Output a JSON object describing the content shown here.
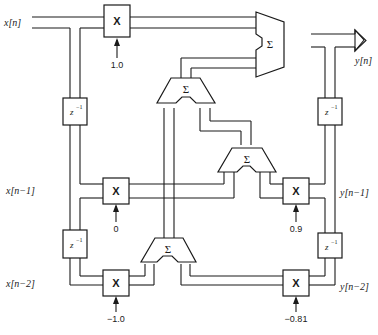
{
  "diagram": {
    "type": "block-diagram",
    "signals": {
      "x_n": "x[n]",
      "x_n1": "x[n−1]",
      "x_n2": "x[n−2]",
      "y_n": "y[n]",
      "y_n1": "y[n−1]",
      "y_n2": "y[n−2]"
    },
    "multipliers": {
      "symbol": "X",
      "b0": "1.0",
      "b1": "0",
      "b2": "−1.0",
      "a1": "0.9",
      "a2": "−0.81"
    },
    "delays": {
      "label": "z",
      "superscript": "−1"
    },
    "adders": {
      "symbol": "Σ"
    },
    "colors": {
      "stroke": "#1a1a1a",
      "background": "#ffffff"
    }
  }
}
